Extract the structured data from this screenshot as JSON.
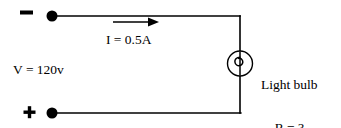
{
  "figure": {
    "name": "dc-circuit-light-bulb",
    "type": "schematic-circuit-diagram",
    "background_color": "#ffffff",
    "line_color": "#000000"
  },
  "terminals": {
    "negative": {
      "sign": "−",
      "label_name": "negative-terminal-sign",
      "dot": {
        "cx": 52,
        "cy": 16,
        "r": 5.5
      },
      "sign_pos": {
        "x": 20,
        "y": 10,
        "w": 13,
        "h": 4
      }
    },
    "positive": {
      "sign": "+",
      "label_name": "positive-terminal-sign",
      "dot": {
        "cx": 52,
        "cy": 113,
        "r": 5.5
      },
      "sign_pos": {
        "x": 24,
        "y": 107,
        "w": 11,
        "h": 11
      }
    }
  },
  "wires": {
    "top": {
      "x1": 52,
      "y1": 16,
      "x2": 240,
      "y2": 16
    },
    "right_upper": {
      "x1": 240,
      "y1": 16,
      "x2": 240,
      "y2": 51
    },
    "right_lower": {
      "x1": 240,
      "y1": 76,
      "x2": 240,
      "y2": 113
    },
    "bottom": {
      "x1": 240,
      "y1": 113,
      "x2": 52,
      "y2": 113
    },
    "stroke_width": 1.6
  },
  "current_arrow": {
    "name": "current-direction-arrow",
    "direction": "right",
    "shaft": {
      "x1": 113,
      "y1": 22,
      "x2": 150,
      "y2": 22
    },
    "head_tip_x": 159,
    "head_half_height": 4.5
  },
  "light_bulb": {
    "name": "light-bulb-symbol",
    "circle": {
      "cx": 240,
      "cy": 63.5,
      "r": 12.5
    },
    "filament_type": "spiral-loop"
  },
  "labels": {
    "current": "I = 0.5A",
    "voltage": "V = 120v",
    "bulb_name": "Light bulb",
    "bulb_resistance": "R = ?"
  },
  "values": {
    "current_amperes": 0.5,
    "voltage_volts": 120,
    "resistance_ohms": null,
    "resistance_display": "?"
  }
}
